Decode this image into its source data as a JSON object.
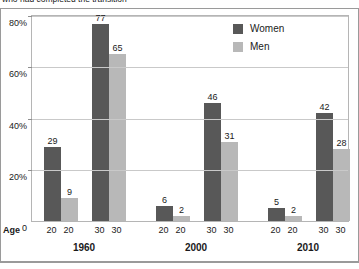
{
  "caption": "who had completed the transition",
  "legend": {
    "items": [
      {
        "label": "Women",
        "color": "#585858"
      },
      {
        "label": "Men",
        "color": "#b8b8b8"
      }
    ]
  },
  "axis": {
    "age_label": "Age",
    "y_ticks": [
      "80%",
      "60%",
      "40%",
      "20%",
      "0"
    ]
  },
  "chart_data": {
    "type": "bar",
    "title": "who had completed the transition",
    "xlabel": "Age",
    "ylabel": "",
    "ylim": [
      0,
      80
    ],
    "grid": true,
    "legend_position": "top-right",
    "group_labels": [
      "1960",
      "2000",
      "2010"
    ],
    "categories": [
      "20",
      "20",
      "30",
      "30",
      "20",
      "20",
      "30",
      "30",
      "20",
      "20",
      "30",
      "30"
    ],
    "series": [
      {
        "name": "Women",
        "color": "#585858",
        "values": [
          29,
          null,
          77,
          null,
          6,
          null,
          46,
          null,
          5,
          null,
          42,
          null
        ]
      },
      {
        "name": "Men",
        "color": "#b8b8b8",
        "values": [
          null,
          9,
          null,
          65,
          null,
          2,
          null,
          31,
          null,
          2,
          null,
          28
        ]
      }
    ],
    "bars": [
      {
        "group": "1960",
        "age": "20",
        "series": "Women",
        "value": 29
      },
      {
        "group": "1960",
        "age": "20",
        "series": "Men",
        "value": 9
      },
      {
        "group": "1960",
        "age": "30",
        "series": "Women",
        "value": 77
      },
      {
        "group": "1960",
        "age": "30",
        "series": "Men",
        "value": 65
      },
      {
        "group": "2000",
        "age": "20",
        "series": "Women",
        "value": 6
      },
      {
        "group": "2000",
        "age": "20",
        "series": "Men",
        "value": 2
      },
      {
        "group": "2000",
        "age": "30",
        "series": "Women",
        "value": 46
      },
      {
        "group": "2000",
        "age": "30",
        "series": "Men",
        "value": 31
      },
      {
        "group": "2010",
        "age": "20",
        "series": "Women",
        "value": 5
      },
      {
        "group": "2010",
        "age": "20",
        "series": "Men",
        "value": 2
      },
      {
        "group": "2010",
        "age": "30",
        "series": "Women",
        "value": 42
      },
      {
        "group": "2010",
        "age": "30",
        "series": "Men",
        "value": 28
      }
    ]
  }
}
